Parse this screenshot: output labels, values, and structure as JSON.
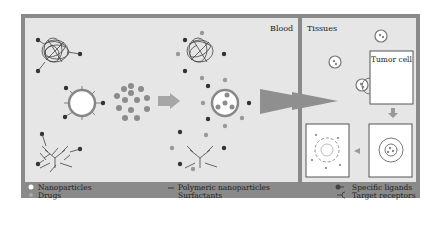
{
  "regions": {
    "blood": "Blood",
    "tissues": "Tissues",
    "tumor_cell": "Tumor cell"
  },
  "legend": {
    "nanoparticles": "Nanoparticles",
    "drugs": "Drugs",
    "polymeric": "Polymeric nanoparticles",
    "surfactants": "Surfactants",
    "ligands": "Specific ligands",
    "receptors": "Target receptors"
  },
  "colors": {
    "frame": "#8a8a8a",
    "panel": "#e6e6e6",
    "dark_node": "#333333",
    "drug": "#8c8c8c"
  }
}
